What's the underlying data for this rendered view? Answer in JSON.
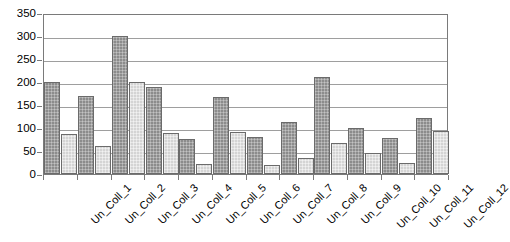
{
  "chart_data": {
    "type": "bar",
    "title": "",
    "subtitle": "",
    "xlabel": "",
    "ylabel": "",
    "ylim": [
      0,
      350
    ],
    "yticks": [
      0,
      50,
      100,
      150,
      200,
      250,
      300,
      350
    ],
    "ytick_labels": [
      "0",
      "50",
      "100",
      "150",
      "200",
      "250",
      "300",
      "350"
    ],
    "grid": true,
    "legend": false,
    "legend_position": "none",
    "orientation": "vertical",
    "categories": [
      "Un_Coll_1",
      "Un_Coll_2",
      "Un_Coll_3",
      "Un_Coll_4",
      "Un_Coll_5",
      "Un_Coll_6",
      "Un_Coll_7",
      "Un_Coll_8",
      "Un_Coll_9",
      "Un_Coll_10",
      "Un_Coll_11",
      "Un_Coll_12"
    ],
    "series": [
      {
        "name": "Series 1",
        "color": "#8c8c8c",
        "values": [
          200,
          170,
          300,
          190,
          77,
          167,
          80,
          112,
          210,
          101,
          79,
          122
        ]
      },
      {
        "name": "Series 2",
        "color": "#d4d4d4",
        "values": [
          88,
          60,
          200,
          89,
          22,
          92,
          19,
          34,
          67,
          45,
          24,
          93
        ]
      }
    ],
    "axis_color": "#7a7a7a",
    "gridline_color": "#9e9e9e",
    "background": "#ffffff"
  }
}
